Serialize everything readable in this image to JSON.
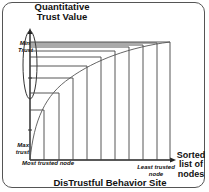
{
  "diagram": {
    "title_y_axis": "Quantitative Trust Value",
    "y_top_label": "Min Trust",
    "y_bottom_label": "Max trust",
    "x_axis_label": "Sorted list of nodes",
    "x_left_label": "Most trusted node",
    "x_right_label": "Least trusted node",
    "caption": "DisTrustful Behavior Site",
    "colors": {
      "line": "#333333",
      "frame": "#555555",
      "background": "#ffffff"
    }
  }
}
